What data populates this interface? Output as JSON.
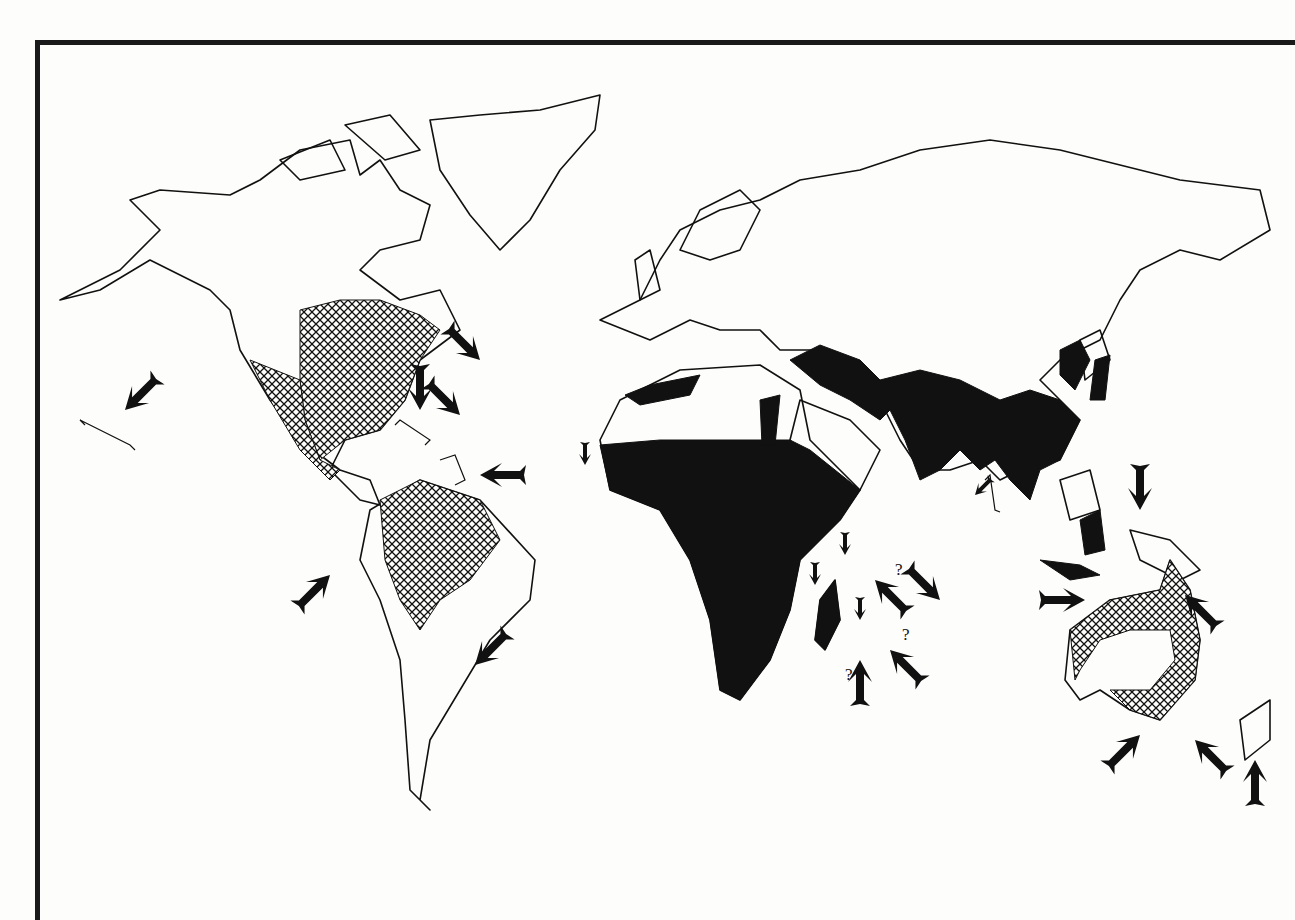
{
  "figure": {
    "type": "world-distribution-map",
    "legend_patterns": [
      {
        "pattern": "solid-black",
        "meaning": "native range"
      },
      {
        "pattern": "cross-hatch",
        "meaning": "introduced range"
      }
    ],
    "colors": {
      "ink": "#111111",
      "paper": "#fdfdfb"
    }
  },
  "regions": {
    "solid": [
      "Africa (sub-Saharan)",
      "North Africa coast",
      "Middle East",
      "India",
      "Southeast Asia",
      "Southern China",
      "Korea",
      "Japan",
      "Indonesia islands",
      "Madagascar"
    ],
    "hatched": [
      "Eastern North America",
      "Mexico",
      "Northern South America",
      "Australia coast"
    ]
  },
  "arrows": [
    {
      "id": "a1",
      "x": 125,
      "y": 410,
      "dir": "sw",
      "size": "large",
      "note": "Hawaii"
    },
    {
      "id": "a2",
      "x": 480,
      "y": 360,
      "dir": "se",
      "size": "large"
    },
    {
      "id": "a3",
      "x": 420,
      "y": 410,
      "dir": "s",
      "size": "large"
    },
    {
      "id": "a4",
      "x": 460,
      "y": 415,
      "dir": "se",
      "size": "large"
    },
    {
      "id": "a5",
      "x": 480,
      "y": 475,
      "dir": "w",
      "size": "large"
    },
    {
      "id": "a6",
      "x": 330,
      "y": 575,
      "dir": "ne",
      "size": "large"
    },
    {
      "id": "a7",
      "x": 475,
      "y": 665,
      "dir": "sw",
      "size": "large"
    },
    {
      "id": "a8",
      "x": 585,
      "y": 465,
      "dir": "s",
      "size": "small"
    },
    {
      "id": "a9",
      "x": 975,
      "y": 495,
      "dir": "sw",
      "size": "small"
    },
    {
      "id": "a10",
      "x": 815,
      "y": 585,
      "dir": "s",
      "size": "small"
    },
    {
      "id": "a11",
      "x": 845,
      "y": 555,
      "dir": "s",
      "size": "small"
    },
    {
      "id": "a12",
      "x": 860,
      "y": 620,
      "dir": "s",
      "size": "small"
    },
    {
      "id": "a13",
      "x": 875,
      "y": 580,
      "dir": "nw",
      "size": "large",
      "question": true
    },
    {
      "id": "a14",
      "x": 940,
      "y": 600,
      "dir": "se",
      "size": "large"
    },
    {
      "id": "a15",
      "x": 860,
      "y": 660,
      "dir": "n",
      "size": "large",
      "question": true
    },
    {
      "id": "a16",
      "x": 890,
      "y": 650,
      "dir": "nw",
      "size": "large",
      "question": true
    },
    {
      "id": "a17",
      "x": 1140,
      "y": 510,
      "dir": "s",
      "size": "large"
    },
    {
      "id": "a18",
      "x": 1085,
      "y": 600,
      "dir": "e",
      "size": "large"
    },
    {
      "id": "a19",
      "x": 1185,
      "y": 595,
      "dir": "nw",
      "size": "large"
    },
    {
      "id": "a20",
      "x": 1140,
      "y": 735,
      "dir": "ne",
      "size": "large"
    },
    {
      "id": "a21",
      "x": 1195,
      "y": 740,
      "dir": "nw",
      "size": "large"
    },
    {
      "id": "a22",
      "x": 1255,
      "y": 760,
      "dir": "n",
      "size": "large"
    }
  ],
  "question_marks": [
    {
      "x": 895,
      "y": 575,
      "text": "?"
    },
    {
      "x": 845,
      "y": 680,
      "text": "?"
    },
    {
      "x": 902,
      "y": 640,
      "text": "?"
    }
  ]
}
